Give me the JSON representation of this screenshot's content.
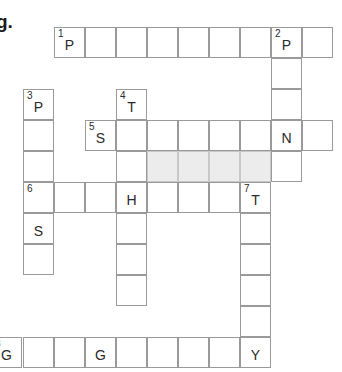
{
  "heading": {
    "text": "g."
  },
  "grid": {
    "cell_size": 31,
    "colors": {
      "border": "#9a9a9a",
      "shaded": "#ececec",
      "text": "#2a2a2a"
    },
    "cells": [
      {
        "x": 54,
        "y": 27,
        "num": "1",
        "letter": "P"
      },
      {
        "x": 85,
        "y": 27
      },
      {
        "x": 116,
        "y": 27
      },
      {
        "x": 147,
        "y": 27
      },
      {
        "x": 178,
        "y": 27
      },
      {
        "x": 209,
        "y": 27
      },
      {
        "x": 240,
        "y": 27
      },
      {
        "x": 271,
        "y": 27,
        "num": "2",
        "letter": "P"
      },
      {
        "x": 302,
        "y": 27
      },
      {
        "x": 271,
        "y": 58
      },
      {
        "x": 271,
        "y": 89
      },
      {
        "x": 271,
        "y": 151
      },
      {
        "x": 23,
        "y": 89,
        "num": "3",
        "letter": "P"
      },
      {
        "x": 23,
        "y": 120
      },
      {
        "x": 23,
        "y": 151
      },
      {
        "x": 23,
        "y": 213,
        "letter": "S"
      },
      {
        "x": 23,
        "y": 244
      },
      {
        "x": 116,
        "y": 89,
        "num": "4",
        "letter": "T"
      },
      {
        "x": 116,
        "y": 151
      },
      {
        "x": 116,
        "y": 213
      },
      {
        "x": 116,
        "y": 244
      },
      {
        "x": 116,
        "y": 275
      },
      {
        "x": 85,
        "y": 120,
        "num": "5",
        "letter": "S"
      },
      {
        "x": 116,
        "y": 120
      },
      {
        "x": 147,
        "y": 120
      },
      {
        "x": 178,
        "y": 120
      },
      {
        "x": 209,
        "y": 120
      },
      {
        "x": 240,
        "y": 120
      },
      {
        "x": 271,
        "y": 120,
        "letter": "N"
      },
      {
        "x": 302,
        "y": 120
      },
      {
        "x": 147,
        "y": 151,
        "shaded": true
      },
      {
        "x": 178,
        "y": 151,
        "shaded": true
      },
      {
        "x": 209,
        "y": 151,
        "shaded": true
      },
      {
        "x": 240,
        "y": 151,
        "shaded": true
      },
      {
        "x": 23,
        "y": 182,
        "num": "6"
      },
      {
        "x": 54,
        "y": 182
      },
      {
        "x": 85,
        "y": 182
      },
      {
        "x": 116,
        "y": 182,
        "letter": "H"
      },
      {
        "x": 147,
        "y": 182
      },
      {
        "x": 178,
        "y": 182
      },
      {
        "x": 209,
        "y": 182
      },
      {
        "x": 240,
        "y": 182,
        "num": "7",
        "letter": "T"
      },
      {
        "x": 240,
        "y": 213
      },
      {
        "x": 240,
        "y": 244
      },
      {
        "x": 240,
        "y": 275
      },
      {
        "x": 240,
        "y": 306
      },
      {
        "x": -9,
        "y": 337,
        "num": "8",
        "letter": "G"
      },
      {
        "x": 23,
        "y": 337
      },
      {
        "x": 54,
        "y": 337
      },
      {
        "x": 85,
        "y": 337,
        "letter": "G"
      },
      {
        "x": 116,
        "y": 337
      },
      {
        "x": 147,
        "y": 337
      },
      {
        "x": 178,
        "y": 337
      },
      {
        "x": 209,
        "y": 337
      },
      {
        "x": 240,
        "y": 337,
        "letter": "Y"
      }
    ]
  },
  "entries": {
    "across": [
      {
        "num": "1",
        "length": 9,
        "given": "P _ _ _ _ _ _ P _"
      },
      {
        "num": "5",
        "length": 8,
        "given": "S _ _ _ _ _ N _"
      },
      {
        "num": "6",
        "length": 8,
        "given": "_ _ _ H _ _ _ T"
      },
      {
        "num": "8",
        "length": 9,
        "given": "G _ _ G _ _ _ _ Y"
      }
    ],
    "down": [
      {
        "num": "2",
        "length": 5,
        "given": "P _ _ N _"
      },
      {
        "num": "3",
        "length": 6,
        "given": "P _ _ _ S _"
      },
      {
        "num": "4",
        "length": 7,
        "given": "T _ _ H _ _ _"
      },
      {
        "num": "7",
        "length": 6,
        "given": "T _ _ _ _ Y"
      }
    ]
  }
}
